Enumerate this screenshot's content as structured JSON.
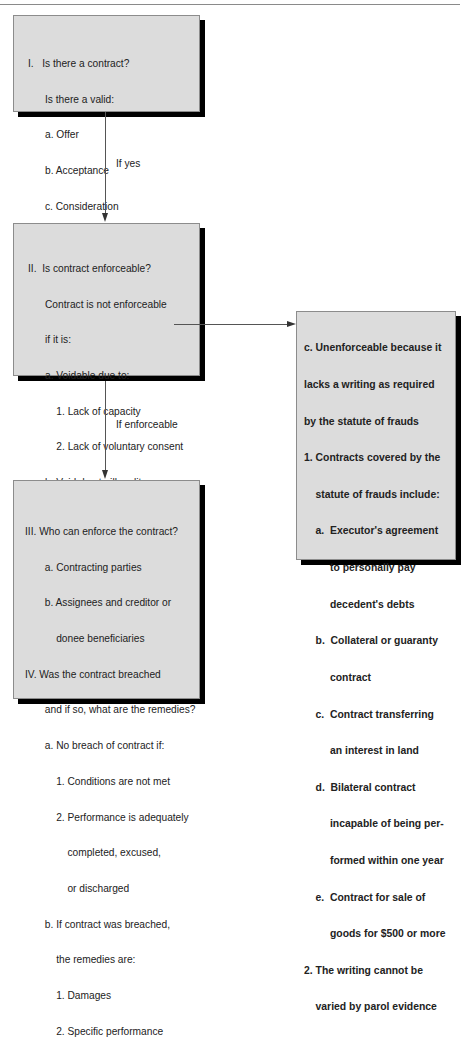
{
  "boxes": {
    "box1": {
      "lines": [
        "I.   Is there a contract?",
        "      Is there a valid:",
        "      a. Offer",
        "      b. Acceptance",
        "      c. Consideration"
      ]
    },
    "box2": {
      "lines": [
        "II.  Is contract enforceable?",
        "      Contract is not enforceable",
        "      if it is:",
        "      a. Voidable due to:",
        "          1. Lack of capacity",
        "          2. Lack of voluntary consent",
        "      b. Void due to illegality",
        "      c. Unenforceable because it",
        "          lacks a writing as required",
        "          by the statute of frauds"
      ]
    },
    "box3": {
      "lines": [
        "III. Who can enforce the contract?",
        "       a. Contracting parties",
        "       b. Assignees and creditor or",
        "           donee beneficiaries",
        "IV. Was the contract breached",
        "       and if so, what are the remedies?",
        "       a. No breach of contract if:",
        "           1. Conditions are not met",
        "           2. Performance is adequately",
        "               completed, excused,",
        "               or discharged",
        "       b. If contract was breached,",
        "           the remedies are:",
        "           1. Damages",
        "           2. Specific performance"
      ]
    },
    "box4": {
      "lines": [
        "c. Unenforceable because it",
        "lacks a writing as required",
        "by the statute of frauds",
        "1. Contracts covered by the",
        "    statute of frauds include:",
        "    a.  Executor's agreement",
        "         to personally pay",
        "         decedent's debts",
        "    b.  Collateral or guaranty",
        "         contract",
        "    c.  Contract transferring",
        "         an interest in land",
        "    d.  Bilateral contract",
        "         incapable of being per-",
        "         formed within one year",
        "    e.  Contract for sale of",
        "         goods for $500 or more",
        "2. The writing cannot be",
        "    varied by parol evidence"
      ]
    }
  },
  "connectors": {
    "yes_label": "If yes",
    "enforceable_label": "If enforceable"
  },
  "colors": {
    "box_fill": "#dcdcdc",
    "shadow": "#000000",
    "line": "#555555"
  }
}
